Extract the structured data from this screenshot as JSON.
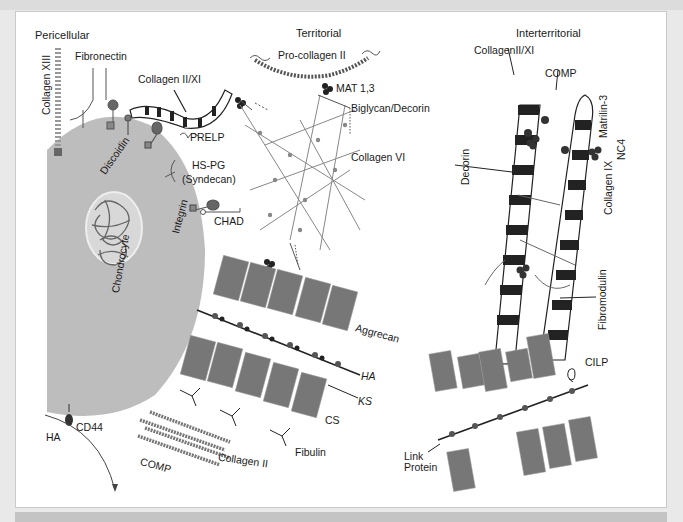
{
  "figure": {
    "regions": {
      "pericellular": "Pericellular",
      "territorial": "Territorial",
      "interterritorial": "Interterritorial"
    },
    "labels": {
      "collagen_xiii": "Collagen XIII",
      "fibronectin": "Fibronectin",
      "collagen_ii_xi": "Collagen II/XI",
      "discoidin": "Discoidin",
      "prelp": "PRELP",
      "hs_pg": "HS-PG",
      "syndecan": "(Syndecan)",
      "integrin": "Integrin",
      "chad": "CHAD",
      "chondrocyte": "Chondrocyte",
      "pro_collagen_ii": "Pro-collagen II",
      "mat_1_3": "MAT 1,3",
      "biglycan_decorin": "Biglycan/Decorin",
      "collagen_vi": "Collagen VI",
      "aggrecan": "Aggrecan",
      "ha_right": "HA",
      "ks": "KS",
      "cs": "CS",
      "fibulin": "Fibulin",
      "cd44": "CD44",
      "ha_left": "HA",
      "comp_bottom": "COMP",
      "collagen_ii_bottom": "Collagen II",
      "collagenii_xi_inter": "CollagenII/XI",
      "comp_inter": "COMP",
      "matrilin_3": "Matrilin-3",
      "nc4": "NC4",
      "collagen_ix": "Collagen IX",
      "decorin": "Decorin",
      "fibromodulin": "Fibromodulin",
      "cilp": "CILP",
      "link_protein": "Link Protein"
    },
    "colors": {
      "cell": "#bdbdbd",
      "nucleus_bg": "#d8d8d8",
      "dark": "#222222",
      "mid": "#7a7a7a",
      "frame_bg": "#ffffff",
      "page_bg": "#e9e9e9"
    }
  }
}
